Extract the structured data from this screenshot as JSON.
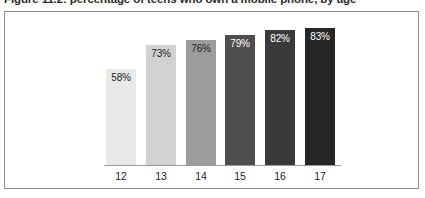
{
  "figure": {
    "title": "Figure 11.2: percentage of teens who own a mobile phone, by age"
  },
  "chart_data": {
    "type": "bar",
    "title": "Figure 11.2: percentage of teens who own a mobile phone, by age",
    "xlabel": "",
    "ylabel": "",
    "ylim": [
      0,
      100
    ],
    "grid": false,
    "legend": false,
    "categories": [
      "12",
      "13",
      "14",
      "15",
      "16",
      "17"
    ],
    "values": [
      58,
      73,
      76,
      79,
      82,
      83
    ],
    "data_labels": [
      "58%",
      "73%",
      "76%",
      "79%",
      "82%",
      "83%"
    ],
    "bar_colors": [
      "#e9e9e9",
      "#d2d2d2",
      "#9c9c9c",
      "#4e4e4e",
      "#3a3a3a",
      "#262626"
    ],
    "label_colors": [
      "#1c1c1c",
      "#1c1c1c",
      "#1c1c1c",
      "#ffffff",
      "#ffffff",
      "#ffffff"
    ]
  },
  "style": {
    "frame_border": "#8d8d8d",
    "axis_line": "#9a9a9a",
    "background": "#ffffff"
  }
}
